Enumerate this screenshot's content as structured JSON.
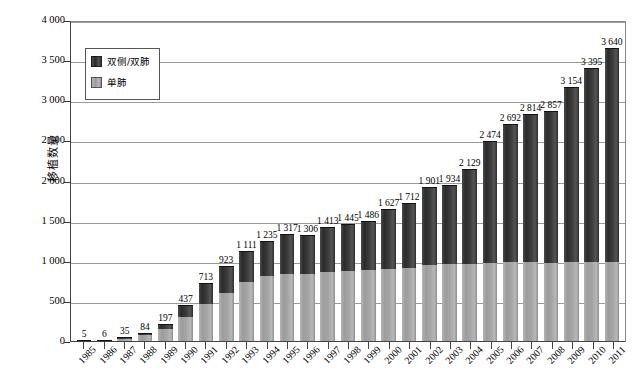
{
  "chart_data": {
    "type": "bar",
    "stacked": true,
    "title": "",
    "xlabel": "",
    "ylabel": "移植数量",
    "ylim": [
      0,
      4000
    ],
    "ytick_step": 500,
    "ytick_labels": [
      "4 000",
      "3 500",
      "3 000",
      "2 500",
      "2 000",
      "1 500",
      "1 000",
      "500",
      "0"
    ],
    "ytick_values": [
      4000,
      3500,
      3000,
      2500,
      2000,
      1500,
      1000,
      500,
      0
    ],
    "grid": true,
    "legend_position": "upper-left-inside",
    "legend": [
      "双侧/双肺",
      "单肺"
    ],
    "categories": [
      "1985",
      "1986",
      "1987",
      "1988",
      "1989",
      "1990",
      "1991",
      "1992",
      "1993",
      "1994",
      "1995",
      "1996",
      "1997",
      "1998",
      "1999",
      "2000",
      "2001",
      "2002",
      "2003",
      "2004",
      "2005",
      "2006",
      "2007",
      "2008",
      "2009",
      "2010",
      "2011"
    ],
    "total_labels": [
      "5",
      "6",
      "35",
      "84",
      "197",
      "437",
      "713",
      "923",
      "1 111",
      "1 235",
      "1 317",
      "1 306",
      "1 413",
      "1 445",
      "1 486",
      "1 627",
      "1 712",
      "1 901",
      "1 934",
      "2 129",
      "2 474",
      "2 692",
      "2 814",
      "2 857",
      "3 154",
      "3 395",
      "3 640"
    ],
    "totals": [
      5,
      6,
      35,
      84,
      197,
      437,
      713,
      923,
      1111,
      1235,
      1317,
      1306,
      1413,
      1445,
      1486,
      1627,
      1712,
      1901,
      1934,
      2129,
      2474,
      2692,
      2814,
      2857,
      3154,
      3395,
      3640
    ],
    "series": [
      {
        "name": "单肺",
        "color": "#a6a6a6",
        "values": [
          3,
          4,
          28,
          70,
          150,
          300,
          460,
          600,
          740,
          810,
          840,
          830,
          860,
          870,
          880,
          900,
          915,
          950,
          955,
          960,
          975,
          985,
          980,
          975,
          980,
          985,
          985
        ]
      },
      {
        "name": "双侧/双肺",
        "color": "#3a3a3a",
        "values": [
          2,
          2,
          7,
          14,
          47,
          137,
          253,
          323,
          371,
          425,
          477,
          476,
          553,
          575,
          606,
          727,
          797,
          951,
          979,
          1169,
          1499,
          1707,
          1834,
          1882,
          2174,
          2410,
          2655
        ]
      }
    ],
    "colors": {
      "double_lung": "#3a3a3a",
      "single_lung": "#a6a6a6",
      "gridline": "#9a9a9a",
      "axis": "#444444",
      "background": "#ffffff"
    }
  }
}
